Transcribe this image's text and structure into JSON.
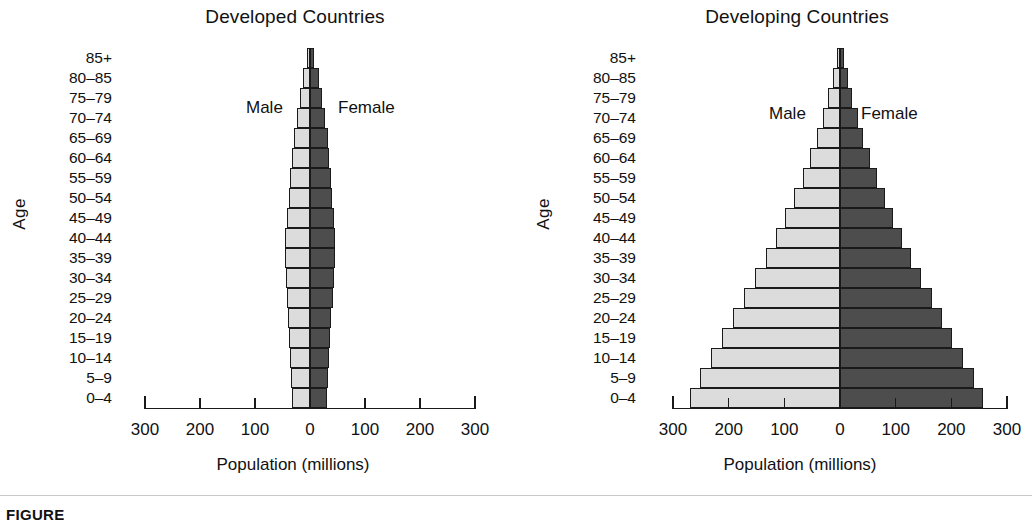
{
  "figure": {
    "caption": "FIGURE",
    "axis_x_title": "Population (millions)",
    "axis_y_title": "Age",
    "male_label": "Male",
    "female_label": "Female",
    "male_color": "#dcdcdc",
    "female_color": "#4d4d4d",
    "xticks": [
      "300",
      "200",
      "100",
      "0",
      "100",
      "200",
      "300"
    ]
  },
  "panels": [
    {
      "title": "Developed Countries"
    },
    {
      "title": "Developing Countries"
    }
  ],
  "chart_data": [
    {
      "type": "bar",
      "title": "Developed Countries",
      "orientation": "horizontal-diverging",
      "xlabel": "Population (millions)",
      "ylabel": "Age",
      "xlim": [
        -300,
        300
      ],
      "xtick_values": [
        -300,
        -200,
        -100,
        0,
        100,
        200,
        300
      ],
      "xtick_labels": [
        "300",
        "200",
        "100",
        "0",
        "100",
        "200",
        "300"
      ],
      "grid": false,
      "legend": [
        "Male",
        "Female"
      ],
      "legend_position": "inside-top-center",
      "categories": [
        "0–4",
        "5–9",
        "10–14",
        "15–19",
        "20–24",
        "25–29",
        "30–34",
        "35–39",
        "40–44",
        "45–49",
        "50–54",
        "55–59",
        "60–64",
        "65–69",
        "70–74",
        "75–79",
        "80–85",
        "85+"
      ],
      "series": [
        {
          "name": "Male",
          "side": "left",
          "values": [
            32,
            34,
            36,
            38,
            40,
            42,
            44,
            46,
            45,
            42,
            39,
            36,
            33,
            29,
            24,
            18,
            12,
            5
          ]
        },
        {
          "name": "Female",
          "side": "right",
          "values": [
            31,
            33,
            35,
            37,
            39,
            41,
            43,
            45,
            45,
            43,
            40,
            38,
            35,
            32,
            28,
            22,
            16,
            8
          ]
        }
      ]
    },
    {
      "type": "bar",
      "title": "Developing Countries",
      "orientation": "horizontal-diverging",
      "xlabel": "Population (millions)",
      "ylabel": "Age",
      "xlim": [
        -300,
        300
      ],
      "xtick_values": [
        -300,
        -200,
        -100,
        0,
        100,
        200,
        300
      ],
      "xtick_labels": [
        "300",
        "200",
        "100",
        "0",
        "100",
        "200",
        "300"
      ],
      "grid": false,
      "legend": [
        "Male",
        "Female"
      ],
      "legend_position": "inside-top-center",
      "categories": [
        "0–4",
        "5–9",
        "10–14",
        "15–19",
        "20–24",
        "25–29",
        "30–34",
        "35–39",
        "40–44",
        "45–49",
        "50–54",
        "55–59",
        "60–64",
        "65–69",
        "70–74",
        "75–79",
        "80–85",
        "85+"
      ],
      "series": [
        {
          "name": "Male",
          "side": "left",
          "values": [
            270,
            252,
            232,
            212,
            192,
            172,
            152,
            133,
            115,
            98,
            82,
            67,
            54,
            42,
            31,
            21,
            13,
            6
          ]
        },
        {
          "name": "Female",
          "side": "right",
          "values": [
            256,
            240,
            221,
            202,
            184,
            165,
            146,
            128,
            111,
            95,
            80,
            66,
            53,
            42,
            32,
            22,
            14,
            7
          ]
        }
      ]
    }
  ]
}
